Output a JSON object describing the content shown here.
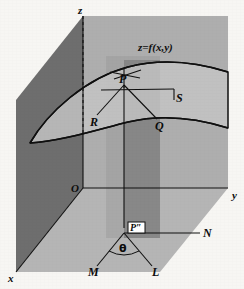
{
  "figure": {
    "background_color": "#f7f6f3",
    "stroke_color": "#101010",
    "axes": {
      "z_label": "z",
      "y_label": "y",
      "x_label": "x",
      "origin_label": "O"
    },
    "surface": {
      "equation_label": "z=f(x,y)",
      "fill_color": "#c6c6c6"
    },
    "planes": {
      "xz_plane_color": "#6e6e6e",
      "yz_plane_color": "#aeaeae",
      "xy_plane_color": "#b5b5b5",
      "vertical_band_color": "#8a8a8a",
      "vertical_band_light_color": "#9d9d9d"
    },
    "points": {
      "p": "P",
      "q": "Q",
      "r": "R",
      "s": "S",
      "p_double_prime": "P″",
      "m": "M",
      "n": "N",
      "l": "L"
    },
    "angle": {
      "theta_label": "θ"
    }
  }
}
